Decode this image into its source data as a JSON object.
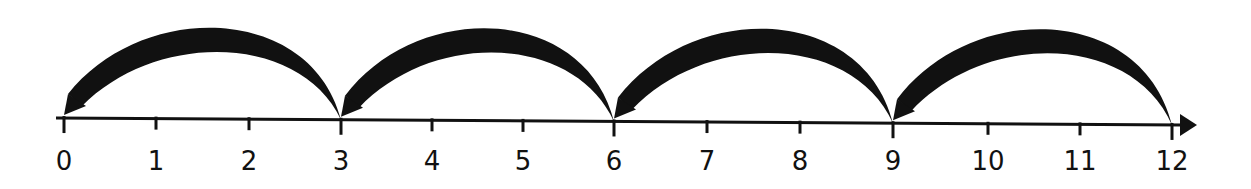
{
  "diagram": {
    "type": "number-line",
    "ticks": [
      "0",
      "1",
      "2",
      "3",
      "4",
      "5",
      "6",
      "7",
      "8",
      "9",
      "10",
      "11",
      "12"
    ],
    "tick_x": [
      64,
      156,
      249,
      341,
      432,
      523,
      614,
      707,
      800,
      893,
      988,
      1080,
      1172
    ],
    "jumps": [
      {
        "from": 12,
        "to": 9
      },
      {
        "from": 9,
        "to": 6
      },
      {
        "from": 6,
        "to": 3
      },
      {
        "from": 3,
        "to": 0
      }
    ],
    "colors": {
      "ink": "#111111",
      "background": "#ffffff"
    }
  }
}
